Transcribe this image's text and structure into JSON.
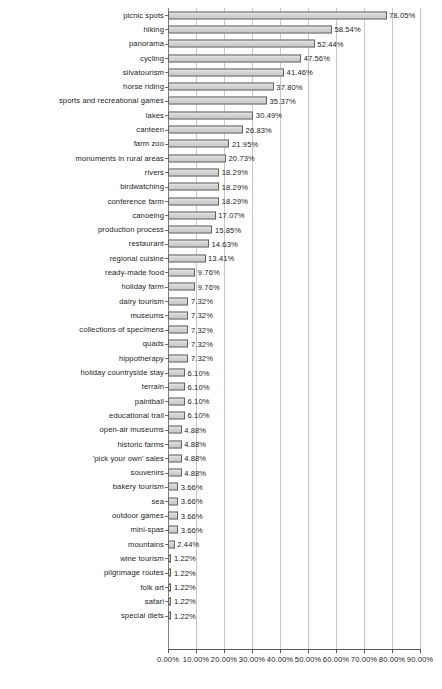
{
  "chart_data": {
    "type": "bar",
    "orientation": "horizontal",
    "title": "",
    "subtitle": "",
    "xlabel": "",
    "ylabel": "",
    "xlim": [
      0,
      90
    ],
    "grid": true,
    "legend": false,
    "value_suffix": "%",
    "axis_tick_labels": [
      "0.00%",
      "10.00%",
      "20.00%",
      "30.00%",
      "40.00%",
      "50.00%",
      "60.00%",
      "70.00%",
      "80.00%",
      "90.00%"
    ],
    "axis_tick_values": [
      0,
      10,
      20,
      30,
      40,
      50,
      60,
      70,
      80,
      90
    ],
    "categories": [
      "picnic spots",
      "hiking",
      "panorama",
      "cycling",
      "silvatourism",
      "horse riding",
      "sports and recreational games",
      "lakes",
      "canteen",
      "farm zoo",
      "monuments in rural areas",
      "rivers",
      "birdwatching",
      "conference farm",
      "canoeing",
      "production process",
      "restaurant",
      "regional cuisine",
      "ready-made food",
      "holiday farm",
      "dairy tourism",
      "museums",
      "collections of specimens",
      "quads",
      "hippotherapy",
      "holiday countryside stay",
      "terrain",
      "paintball",
      "educational trail",
      "open-air museums",
      "historic farms",
      "'pick your own' sales",
      "souvenirs",
      "bakery tourism",
      "sea",
      "outdoor  games",
      "mini-spas",
      "mountains",
      "wine tourism",
      "pilgrimage routes",
      "folk art",
      "safari",
      "special diets"
    ],
    "values": [
      78.05,
      58.54,
      52.44,
      47.56,
      41.46,
      37.8,
      35.37,
      30.49,
      26.83,
      21.95,
      20.73,
      18.29,
      18.29,
      18.29,
      17.07,
      15.85,
      14.63,
      13.41,
      9.76,
      9.76,
      7.32,
      7.32,
      7.32,
      7.32,
      7.32,
      6.1,
      6.1,
      6.1,
      6.1,
      4.88,
      4.88,
      4.88,
      4.88,
      3.66,
      3.66,
      3.66,
      3.66,
      2.44,
      1.22,
      1.22,
      1.22,
      1.22,
      1.22
    ],
    "value_labels": [
      "78.05%",
      "58.54%",
      "52.44%",
      "47.56%",
      "41.46%",
      "37.80%",
      "35.37%",
      "30.49%",
      "26.83%",
      "21.95%",
      "20.73%",
      "18.29%",
      "18.29%",
      "18.29%",
      "17.07%",
      "15.85%",
      "14.63%",
      "13.41%",
      "9.76%",
      "9.76%",
      "7.32%",
      "7.32%",
      "7.32%",
      "7.32%",
      "7.32%",
      "6.10%",
      "6.10%",
      "6.10%",
      "6.10%",
      "4.88%",
      "4.88%",
      "4.88%",
      "4.88%",
      "3.66%",
      "3.66%",
      "3.66%",
      "3.66%",
      "2.44%",
      "1.22%",
      "1.22%",
      "1.22%",
      "1.22%",
      "1.22%"
    ],
    "colors": {
      "bar_fill": "#d6d6d6",
      "bar_border": "#636363",
      "gridline": "#c8c8c8",
      "axis": "#555555",
      "text": "#1c1c1c"
    }
  }
}
